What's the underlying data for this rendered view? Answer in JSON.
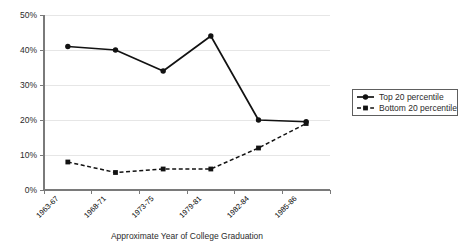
{
  "chart_data": {
    "type": "line",
    "title": "",
    "xlabel": "Approximate Year of College Graduation",
    "ylabel": "",
    "categories": [
      "1963-67",
      "1968-71",
      "1973-75",
      "1979-81",
      "1982-84",
      "1985-86"
    ],
    "ylim": [
      0,
      50
    ],
    "ytick_values": [
      0,
      10,
      20,
      30,
      40,
      50
    ],
    "ytick_labels": [
      "0%",
      "10%",
      "20%",
      "30%",
      "40%",
      "50%"
    ],
    "grid": true,
    "grid_axis": "y",
    "legend_position": "right",
    "series": [
      {
        "name": "Top 20 percentile",
        "style": "solid",
        "marker": "circle",
        "color": "#121212",
        "values": [
          41,
          40,
          34,
          44,
          20,
          19.5
        ]
      },
      {
        "name": "Bottom 20 percentile",
        "style": "dashed",
        "marker": "square",
        "color": "#121212",
        "values": [
          8,
          5,
          6,
          6,
          12,
          19
        ]
      }
    ]
  },
  "legend": {
    "entries": [
      {
        "label": "Top 20 percentile"
      },
      {
        "label": "Bottom 20 percentile"
      }
    ]
  },
  "axes": {
    "x_axis_title": "Approximate Year of College Graduation"
  }
}
